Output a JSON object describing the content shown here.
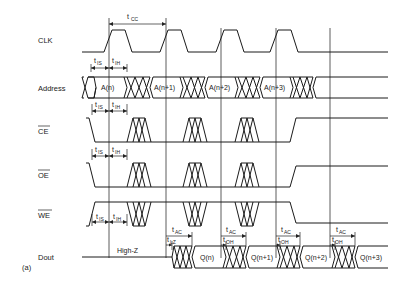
{
  "figure_label": "(a)",
  "signals": {
    "clk": "CLK",
    "address": "Address",
    "ce": "CE",
    "oe": "OE",
    "we": "WE",
    "dout": "Dout"
  },
  "active_low_signals": [
    "CE",
    "OE",
    "WE"
  ],
  "address_values": [
    "A(n)",
    "A(n+1)",
    "A(n+2)",
    "A(n+3)"
  ],
  "dout_values": [
    "Q(n)",
    "Q(n+1)",
    "Q(n+2)",
    "Q(n+3)"
  ],
  "dout_initial_state": "High-Z",
  "timing_params": {
    "cycle": {
      "main": "t",
      "sub": "CC"
    },
    "setup": {
      "main": "t",
      "sub": "IS"
    },
    "hold": {
      "main": "t",
      "sub": "IH"
    },
    "access": {
      "main": "t",
      "sub": "AC"
    },
    "low_z": {
      "main": "t",
      "sub": "LZ"
    },
    "output_hold": {
      "main": "t",
      "sub": "OH"
    }
  }
}
